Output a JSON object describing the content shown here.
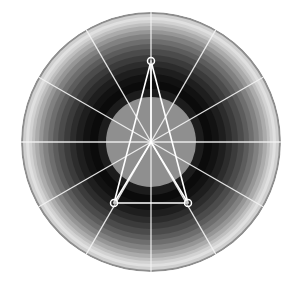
{
  "figure": {
    "background_color": "#ffffff",
    "width": 298,
    "height": 282,
    "title": ""
  },
  "chart_data": {
    "type": "radar",
    "title": "",
    "subtitle": "",
    "xlabel": "",
    "ylabel": "",
    "grid": true,
    "legend": "none",
    "center": {
      "x": 151,
      "y": 142
    },
    "outer_radius": 130,
    "spoke_count": 12,
    "spoke_angles_deg": [
      0,
      30,
      60,
      90,
      120,
      150,
      180,
      210,
      240,
      270,
      300,
      330
    ],
    "spoke_color": "#f2f2f2",
    "spoke_width": 1.3,
    "rlim": [
      0,
      1
    ],
    "ring_band_colors": [
      "#8f8f8f",
      "#1c1c1c",
      "#0b0b0b",
      "#121212",
      "#1e1e1e",
      "#2c2c2c",
      "#3b3b3b",
      "#4b4b4b",
      "#5c5c5c",
      "#6e6e6e",
      "#818181",
      "#969696",
      "#ababab",
      "#bfbfbf",
      "#d2d2d2",
      "#e0e0e0",
      "#cfcfcf",
      "#8d8d8d"
    ],
    "ring_band_outer_radii": [
      45,
      53,
      61,
      68,
      75,
      81,
      87,
      93,
      98,
      103,
      108,
      112,
      116,
      119,
      122,
      125,
      128,
      130
    ],
    "categories": [
      "A",
      "B",
      "C"
    ],
    "angles_deg": [
      90,
      210,
      330
    ],
    "values": [
      0.62,
      0.47,
      0.47
    ],
    "series": [
      {
        "name": "series-1",
        "values": [
          0.62,
          0.47,
          0.47
        ],
        "line_color": "#ffffff",
        "line_width": 1.6,
        "marker": "circle-open",
        "marker_size": 7,
        "marker_edge_color": "#ffffff",
        "marker_face_color": "none"
      }
    ],
    "points_px": [
      {
        "label": "A",
        "x": 151,
        "y": 61
      },
      {
        "label": "B",
        "x": 114,
        "y": 203
      },
      {
        "label": "C",
        "x": 188,
        "y": 203
      }
    ],
    "radial_connectors": true
  }
}
